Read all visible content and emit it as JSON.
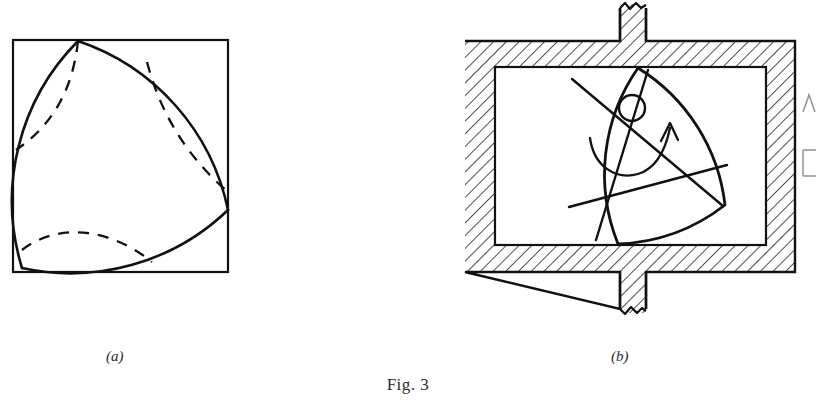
{
  "figure": {
    "title": "Fig. 3",
    "panels": [
      {
        "id": "a",
        "caption": "(a)",
        "subject": "reuleaux-triangle-in-square",
        "description": "Reuleaux triangle of constant width inscribed in a square, with dashed construction arcs",
        "square": {
          "x": 13,
          "y": 40,
          "width": 215,
          "height": 232
        },
        "vertices": [
          {
            "name": "top",
            "x": 78,
            "y": 41
          },
          {
            "name": "right",
            "x": 228,
            "y": 210
          },
          {
            "name": "bottom-left",
            "x": 22,
            "y": 268
          }
        ],
        "solid_arc_count": 3,
        "dashed_arc_count": 3,
        "line_color": "#111111"
      },
      {
        "id": "b",
        "caption": "(b)",
        "subject": "rotary-engine-housing",
        "description": "Reuleaux triangle rotor turning inside a hatched square housing with upper and lower shafts, rotation arrow",
        "outer_frame": {
          "x": 465,
          "y": 41,
          "width": 330,
          "height": 231
        },
        "inner_opening": {
          "x": 495,
          "y": 67,
          "width": 271,
          "height": 178
        },
        "shaft": {
          "x": 620,
          "width": 26,
          "top_break_y": 4,
          "bottom_break_y": 313
        },
        "rotor_vertices": [
          {
            "name": "top",
            "x": 638,
            "y": 68
          },
          {
            "name": "right",
            "x": 725,
            "y": 205
          },
          {
            "name": "bottom",
            "x": 618,
            "y": 244
          }
        ],
        "hub_circle": {
          "cx": 632,
          "cy": 108,
          "r": 13
        },
        "chord_count": 2,
        "rotation_arrow": {
          "direction": "clockwise",
          "arrowhead_x": 670,
          "arrowhead_y": 124
        },
        "hatch_angle_deg": 45,
        "hatch_spacing_px": 9,
        "line_color": "#111111"
      }
    ],
    "edge_artifact": {
      "present": true,
      "description": "partial stroke cropped from adjacent column",
      "x": 806,
      "y": 95
    }
  }
}
